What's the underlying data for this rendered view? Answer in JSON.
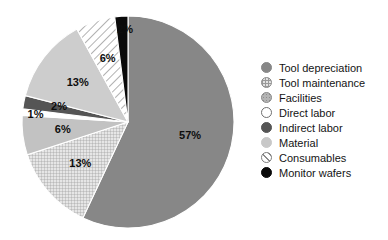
{
  "chart_data": {
    "type": "pie",
    "title": "",
    "subtitle": "",
    "xlabel": "",
    "ylabel": "",
    "legend_position": "right",
    "grid": false,
    "start_angle_deg": 0,
    "direction": "clockwise",
    "total": 100,
    "units": "%",
    "categories": [
      "Tool depreciation",
      "Tool maintenance",
      "Material",
      "Direct labor",
      "Indirect labor",
      "Facilities",
      "Consumables",
      "Monitor wafers"
    ],
    "values": [
      57,
      13,
      6,
      1,
      2,
      13,
      6,
      2
    ],
    "labels": [
      "57%",
      "13%",
      "6%",
      "1%",
      "2%",
      "13%",
      "6%",
      "2%"
    ],
    "slices": [
      {
        "name": "Tool depreciation",
        "value": 57,
        "label": "57%",
        "color": "#878787",
        "pattern": "solid",
        "label_color": "#111111"
      },
      {
        "name": "Tool maintenance",
        "value": 13,
        "label": "13%",
        "color": "#dcdcdc",
        "pattern": "grid",
        "label_color": "#0d0d0d"
      },
      {
        "name": "Material",
        "value": 6,
        "label": "6%",
        "color": "#c2c2c2",
        "pattern": "solid",
        "label_color": "#0d0d0d"
      },
      {
        "name": "Direct labor",
        "value": 1,
        "label": "1%",
        "color": "#ffffff",
        "pattern": "solid",
        "label_color": "#0d0d0d"
      },
      {
        "name": "Indirect labor",
        "value": 2,
        "label": "2%",
        "color": "#555555",
        "pattern": "solid",
        "label_color": "#111111"
      },
      {
        "name": "Facilities",
        "value": 13,
        "label": "13%",
        "color": "#cdcdcd",
        "pattern": "solid",
        "label_color": "#0d0d0d"
      },
      {
        "name": "Consumables",
        "value": 6,
        "label": "6%",
        "color": "#ffffff",
        "pattern": "diagonal-hatch",
        "label_color": "#0d0d0d"
      },
      {
        "name": "Monitor wafers",
        "value": 2,
        "label": "2%",
        "color": "#0a0a0a",
        "pattern": "solid",
        "label_color": "#ffffff"
      }
    ]
  },
  "legend": {
    "items": [
      {
        "label": "Tool depreciation",
        "color": "#878787",
        "pattern": "solid"
      },
      {
        "label": "Tool maintenance",
        "color": "#e2e2e2",
        "pattern": "grid"
      },
      {
        "label": "Facilities",
        "color": "#b4b4b4",
        "pattern": "dots"
      },
      {
        "label": "Direct labor",
        "color": "#ffffff",
        "pattern": "solid"
      },
      {
        "label": "Indirect labor",
        "color": "#555555",
        "pattern": "solid"
      },
      {
        "label": "Material",
        "color": "#c8c8c8",
        "pattern": "solid"
      },
      {
        "label": "Consumables",
        "color": "#ffffff",
        "pattern": "diagonal-hatch"
      },
      {
        "label": "Monitor wafers",
        "color": "#0a0a0a",
        "pattern": "solid"
      }
    ]
  }
}
